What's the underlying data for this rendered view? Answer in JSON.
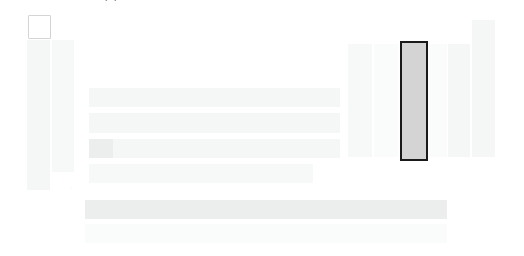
{
  "canvas": {
    "width": 524,
    "height": 256,
    "background": "#ffffff",
    "state_label": "loading-skeleton"
  },
  "colors": {
    "page_background": "#ffffff",
    "skeleton_light": "#f7f8f8",
    "skeleton_mid": "#f5f6f6",
    "skeleton_strong": "#eceded",
    "checkbox_border": "#d4d4d4",
    "selection_border": "#1a1a1a",
    "selection_fill": "#d4d4d4",
    "faint_text": "#e2e3e3",
    "glyph_dark": "#3a3a3a"
  },
  "top_marker": {
    "glyph": "◡",
    "name": "clipped-glyph"
  },
  "left_panel": {
    "checkbox": {
      "name": "select-all-checkbox",
      "checked": false,
      "label": ""
    },
    "bars": [
      {
        "label": ""
      },
      {
        "label": ""
      }
    ]
  },
  "main_rows": [
    {
      "label": ""
    },
    {
      "label": ""
    },
    {
      "label": ""
    },
    {
      "label": ""
    }
  ],
  "row_leading_cell": {
    "name": "row-leading-cell",
    "label": ""
  },
  "footer_bars": [
    {
      "label": ""
    },
    {
      "label": ""
    }
  ],
  "footer_marker": {
    "label": "·"
  },
  "right_panel": {
    "columns": [
      {
        "label": "",
        "selected": false
      },
      {
        "label": "",
        "selected": false
      },
      {
        "label": "",
        "selected": true
      },
      {
        "label": "",
        "selected": false
      },
      {
        "label": "",
        "selected": false
      },
      {
        "label": "",
        "selected": false
      }
    ],
    "selected_index": 2
  }
}
